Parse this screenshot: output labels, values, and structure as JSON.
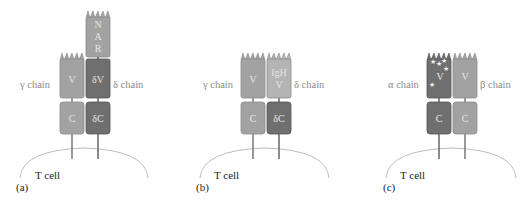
{
  "colors": {
    "light": "#a2a2a2",
    "dark": "#6f6f6f",
    "lighter": "#b4b4b4",
    "border_light": "#8a8a8a",
    "border_dark": "#555555",
    "label_text": "#8a8a8a",
    "cell_text": "#222222",
    "membrane": "#bdbdbd"
  },
  "panels": [
    {
      "id": "a",
      "panel_label": "(a)",
      "cell_label": "T cell",
      "left_chain_label": "γ chain",
      "right_chain_label": "δ chain",
      "domains": {
        "nar": [
          "N",
          "A",
          "R"
        ],
        "left_v": "V",
        "right_v": "δV",
        "left_c": "C",
        "right_c": "δC"
      }
    },
    {
      "id": "b",
      "panel_label": "(b)",
      "cell_label": "T cell",
      "left_chain_label": "γ chain",
      "right_chain_label": "δ chain",
      "domains": {
        "left_v": "V",
        "right_v_line1": "IgH",
        "right_v_line2": "V",
        "left_c": "C",
        "right_c": "δC"
      }
    },
    {
      "id": "c",
      "panel_label": "(c)",
      "cell_label": "T cell",
      "left_chain_label": "α chain",
      "right_chain_label": "β chain",
      "domains": {
        "left_v": "V",
        "right_v": "V",
        "left_c": "C",
        "right_c": "C"
      }
    }
  ]
}
